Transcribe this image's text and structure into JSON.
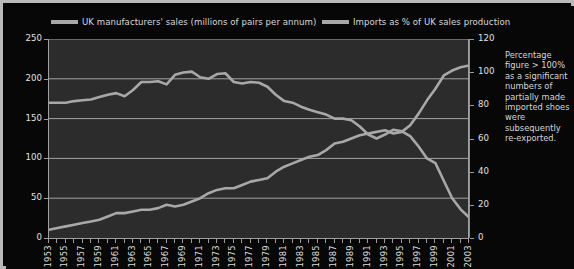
{
  "figure": {
    "background_color": "#070707",
    "plot_background_color": "#2c2c2c",
    "border_color": "#b9b9b9",
    "line_color": "#a8a8a8",
    "gridline_color": "#b0b0b0",
    "text_color": "#e0e0e0"
  },
  "annotation": {
    "text": "Percentage figure > 100% as a significant numbers of partially made imported shoes were subsequently re-exported."
  },
  "chart_data": {
    "type": "line",
    "title": "",
    "subtitle": "",
    "xlabel": "",
    "ylabel": "",
    "grid": "horizontal",
    "legend_position": "top",
    "x": [
      1953,
      1954,
      1955,
      1956,
      1957,
      1958,
      1959,
      1960,
      1961,
      1962,
      1963,
      1964,
      1965,
      1966,
      1967,
      1968,
      1969,
      1970,
      1971,
      1972,
      1973,
      1974,
      1975,
      1976,
      1977,
      1978,
      1979,
      1980,
      1981,
      1982,
      1983,
      1984,
      1985,
      1986,
      1987,
      1988,
      1989,
      1990,
      1991,
      1992,
      1993,
      1994,
      1995,
      1996,
      1997,
      1998,
      1999,
      2000,
      2001,
      2002,
      2003
    ],
    "xtick_labels": [
      "1953",
      "1955",
      "1957",
      "1959",
      "1961",
      "1963",
      "1965",
      "1967",
      "1969",
      "1971",
      "1973",
      "1975",
      "1977",
      "1979",
      "1981",
      "1983",
      "1985",
      "1987",
      "1989",
      "1991",
      "1993",
      "1995",
      "1997",
      "1999",
      "2001",
      "2003"
    ],
    "axes": {
      "left": {
        "label": "UK manufacturers' sales (millions of pairs per annum)",
        "ylim": [
          0,
          250
        ],
        "ticks": [
          0,
          50,
          100,
          150,
          200,
          250
        ]
      },
      "right": {
        "label": "Imports as % of UK sales production",
        "ylim": [
          0,
          120
        ],
        "ticks": [
          0,
          20,
          40,
          60,
          80,
          100,
          120
        ]
      }
    },
    "series": [
      {
        "name": "UK manufacturers' sales (millions of pairs per annum)",
        "axis": "left",
        "unit": "millions of pairs per annum",
        "values": [
          170,
          170,
          170,
          172,
          173,
          174,
          177,
          180,
          182,
          178,
          186,
          196,
          196,
          197,
          193,
          205,
          208,
          209,
          202,
          200,
          206,
          207,
          196,
          194,
          196,
          195,
          190,
          180,
          172,
          170,
          165,
          161,
          158,
          155,
          150,
          150,
          148,
          140,
          130,
          125,
          130,
          136,
          134,
          128,
          115,
          100,
          94,
          72,
          50,
          36,
          26
        ]
      },
      {
        "name": "Imports as % of UK sales production",
        "axis": "right",
        "unit": "% of UK sales production",
        "values": [
          5,
          6,
          7,
          8,
          9,
          10,
          11,
          13,
          15,
          15,
          16,
          17,
          17,
          18,
          20,
          19,
          20,
          22,
          24,
          27,
          29,
          30,
          30,
          32,
          34,
          35,
          36,
          40,
          43,
          45,
          47,
          49,
          50,
          53,
          57,
          58,
          60,
          62,
          63,
          64,
          65,
          63,
          64,
          68,
          75,
          83,
          90,
          98,
          101,
          103,
          104
        ]
      }
    ]
  }
}
